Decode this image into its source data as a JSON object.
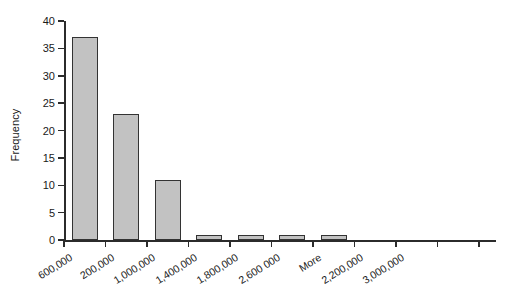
{
  "chart_data": {
    "type": "bar",
    "title": "",
    "subtitle": "",
    "xlabel": "",
    "ylabel": "Frequency",
    "categories": [
      "600,000",
      "200,000",
      "1,000,000",
      "1,400,000",
      "1,800,000",
      "2,600 000",
      "More",
      "2,200,000",
      "3,000,000"
    ],
    "values": [
      37,
      23,
      11,
      1,
      1,
      1,
      1,
      0,
      0
    ],
    "ylim": [
      0,
      40
    ],
    "ytick_values": [
      0,
      5,
      10,
      15,
      20,
      25,
      30,
      35,
      40
    ],
    "ytick_labels": [
      "0",
      "5",
      "10",
      "15",
      "20",
      "25",
      "30",
      "35",
      "40"
    ],
    "grid": false,
    "legend": false,
    "legend_position": "none",
    "bar_fill_color": "#c2c2c2",
    "bar_edge_color": "#333333",
    "axis_color": "#2b2b2b",
    "background_color": "#ffffff",
    "xtick_label_rotation_degrees": -32,
    "annotations": []
  },
  "axis": {
    "y_title": "Frequency"
  }
}
